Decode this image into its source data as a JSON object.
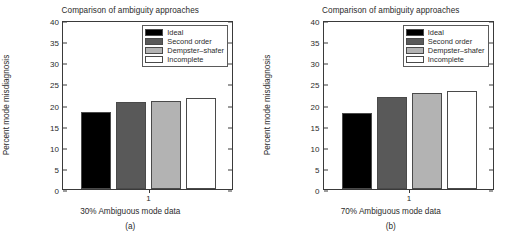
{
  "figure": {
    "panels": [
      {
        "id": "a",
        "caption": "(a)",
        "title": "Comparison of ambiguity approaches",
        "xlabel": "30% Ambiguous mode data",
        "ylabel": "Percent mode misdiagnosis",
        "xtick": "1"
      },
      {
        "id": "b",
        "caption": "(b)",
        "title": "Comparison of ambiguity approaches",
        "xlabel": "70% Ambiguous mode data",
        "ylabel": "Percent mode misdiagnosis",
        "xtick": "1"
      }
    ],
    "yticks": [
      "0",
      "5",
      "10",
      "15",
      "20",
      "25",
      "30",
      "35",
      "40"
    ],
    "legend_labels": [
      "Ideal",
      "Second order",
      "Dempster–shafer",
      "Incomplete"
    ],
    "colors": {
      "ideal": "#000000",
      "second_order": "#595959",
      "dempster_shafer": "#b3b3b3",
      "incomplete": "#ffffff",
      "axis": "#3a3a3a",
      "text": "#2b2b2b",
      "background": "#ffffff"
    }
  },
  "chart_data": [
    {
      "type": "bar",
      "panel": "(a)",
      "title": "Comparison of ambiguity approaches",
      "xlabel": "30% Ambiguous mode data",
      "ylabel": "Percent mode misdiagnosis",
      "categories": [
        "1"
      ],
      "xtick_labels": [
        "1"
      ],
      "ylim": [
        0,
        40
      ],
      "ytick_values": [
        0,
        5,
        10,
        15,
        20,
        25,
        30,
        35,
        40
      ],
      "grid": false,
      "legend_position": "upper right",
      "series": [
        {
          "name": "Ideal",
          "values": [
            18.2
          ],
          "color": "#000000"
        },
        {
          "name": "Second order",
          "values": [
            20.5
          ],
          "color": "#595959"
        },
        {
          "name": "Dempster–shafer",
          "values": [
            20.8
          ],
          "color": "#b3b3b3"
        },
        {
          "name": "Incomplete",
          "values": [
            21.6
          ],
          "color": "#ffffff"
        }
      ]
    },
    {
      "type": "bar",
      "panel": "(b)",
      "title": "Comparison of ambiguity approaches",
      "xlabel": "70% Ambiguous mode data",
      "ylabel": "Percent mode misdiagnosis",
      "categories": [
        "1"
      ],
      "xtick_labels": [
        "1"
      ],
      "ylim": [
        0,
        40
      ],
      "ytick_values": [
        0,
        5,
        10,
        15,
        20,
        25,
        30,
        35,
        40
      ],
      "grid": false,
      "legend_position": "upper right",
      "series": [
        {
          "name": "Ideal",
          "values": [
            18.1
          ],
          "color": "#000000"
        },
        {
          "name": "Second order",
          "values": [
            21.8
          ],
          "color": "#595959"
        },
        {
          "name": "Dempster–shafer",
          "values": [
            22.8
          ],
          "color": "#b3b3b3"
        },
        {
          "name": "Incomplete",
          "values": [
            23.1
          ],
          "color": "#ffffff"
        }
      ]
    }
  ]
}
